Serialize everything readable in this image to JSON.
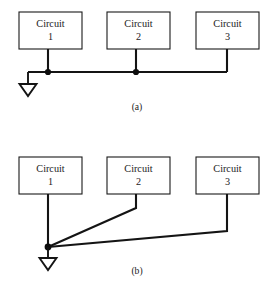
{
  "figure": {
    "background_color": "#ffffff",
    "line_color": "#141414",
    "box_fill": "#ffffff",
    "panels": [
      {
        "id": "panel-a",
        "caption": "(a)",
        "caption_x": 137,
        "caption_y": 108,
        "description": "Daisy-chained single-point ground: three circuit blocks tied to one common horizontal bus returning to a single ground symbol",
        "boxes": [
          {
            "name": "Circuit",
            "number": "1",
            "x": 19,
            "y": 12,
            "w": 63,
            "h": 37
          },
          {
            "name": "Circuit",
            "number": "2",
            "x": 107,
            "y": 12,
            "w": 63,
            "h": 37
          },
          {
            "name": "Circuit",
            "number": "3",
            "x": 196,
            "y": 12,
            "w": 63,
            "h": 37
          }
        ],
        "bus": {
          "x1": 28,
          "y1": 72,
          "x2": 227,
          "y2": 72
        },
        "drops": [
          {
            "x": 48,
            "y1": 49,
            "y2": 72
          },
          {
            "x": 136,
            "y1": 49,
            "y2": 72
          },
          {
            "x": 227,
            "y1": 49,
            "y2": 72
          }
        ],
        "nodes": [
          {
            "x": 48,
            "y": 72,
            "r": 3.1
          },
          {
            "x": 136,
            "y": 72,
            "r": 3.1
          }
        ],
        "ground": {
          "stem_x": 28,
          "stem_y1": 72,
          "stem_y2": 84,
          "tri_half_w": 8.5,
          "tri_h": 12
        }
      },
      {
        "id": "panel-b",
        "caption": "(b)",
        "caption_x": 137,
        "caption_y": 272,
        "description": "Star / single-point ground: each circuit block runs its own separate return wire to one common ground node",
        "boxes": [
          {
            "name": "Circuit",
            "number": "1",
            "x": 19,
            "y": 157,
            "w": 63,
            "h": 37
          },
          {
            "name": "Circuit",
            "number": "2",
            "x": 107,
            "y": 157,
            "w": 63,
            "h": 37
          },
          {
            "name": "Circuit",
            "number": "3",
            "x": 196,
            "y": 157,
            "w": 63,
            "h": 37
          }
        ],
        "returns": [
          {
            "from": "Circuit 1",
            "points": "48,194 48,247"
          },
          {
            "from": "Circuit 2",
            "points": "136,194 136,208 48,247"
          },
          {
            "from": "Circuit 3",
            "points": "227,194 227,231 48,247"
          }
        ],
        "nodes": [
          {
            "x": 48,
            "y": 247,
            "r": 3.4
          }
        ],
        "ground": {
          "stem_x": 48,
          "stem_y1": 247,
          "stem_y2": 258,
          "tri_half_w": 8.5,
          "tri_h": 12
        }
      }
    ]
  }
}
